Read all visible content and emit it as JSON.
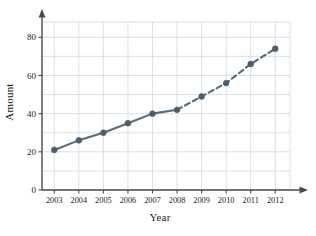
{
  "chart_data": {
    "type": "line",
    "title": "",
    "xlabel": "Year",
    "ylabel": "Amount",
    "categories": [
      "2003",
      "2004",
      "2005",
      "2006",
      "2007",
      "2008",
      "2009",
      "2010",
      "2011",
      "2012"
    ],
    "x": [
      2003,
      2004,
      2005,
      2006,
      2007,
      2008,
      2009,
      2010,
      2011,
      2012
    ],
    "values": [
      21,
      26,
      30,
      35,
      40,
      42,
      49,
      56,
      66,
      74
    ],
    "series": [
      {
        "name": "Amount",
        "style": "solid",
        "x": [
          2003,
          2004,
          2005,
          2006,
          2007,
          2008
        ],
        "values": [
          21,
          26,
          30,
          35,
          40,
          42
        ]
      },
      {
        "name": "Amount (projected)",
        "style": "dashed",
        "x": [
          2008,
          2009,
          2010,
          2011,
          2012
        ],
        "values": [
          42,
          49,
          56,
          66,
          74
        ]
      }
    ],
    "ylim": [
      0,
      88
    ],
    "xlim": [
      2002.5,
      2012.6
    ],
    "yticks": [
      0,
      20,
      40,
      60,
      80
    ],
    "ytick_labels": [
      "0",
      "20",
      "40",
      "60",
      "80"
    ],
    "y_minor_gridline_step": 10,
    "xtick_labels": [
      "2003",
      "2004",
      "2005",
      "2006",
      "2007",
      "2008",
      "2009",
      "2010",
      "2011",
      "2012"
    ],
    "grid": true,
    "legend": "none",
    "colors": {
      "line": "#5b6b78",
      "marker": "#4e5d6b",
      "grid": "#c8d4e0",
      "axis": "#4a4a4a",
      "text": "#1a1a1a",
      "background": "#ffffff"
    }
  }
}
